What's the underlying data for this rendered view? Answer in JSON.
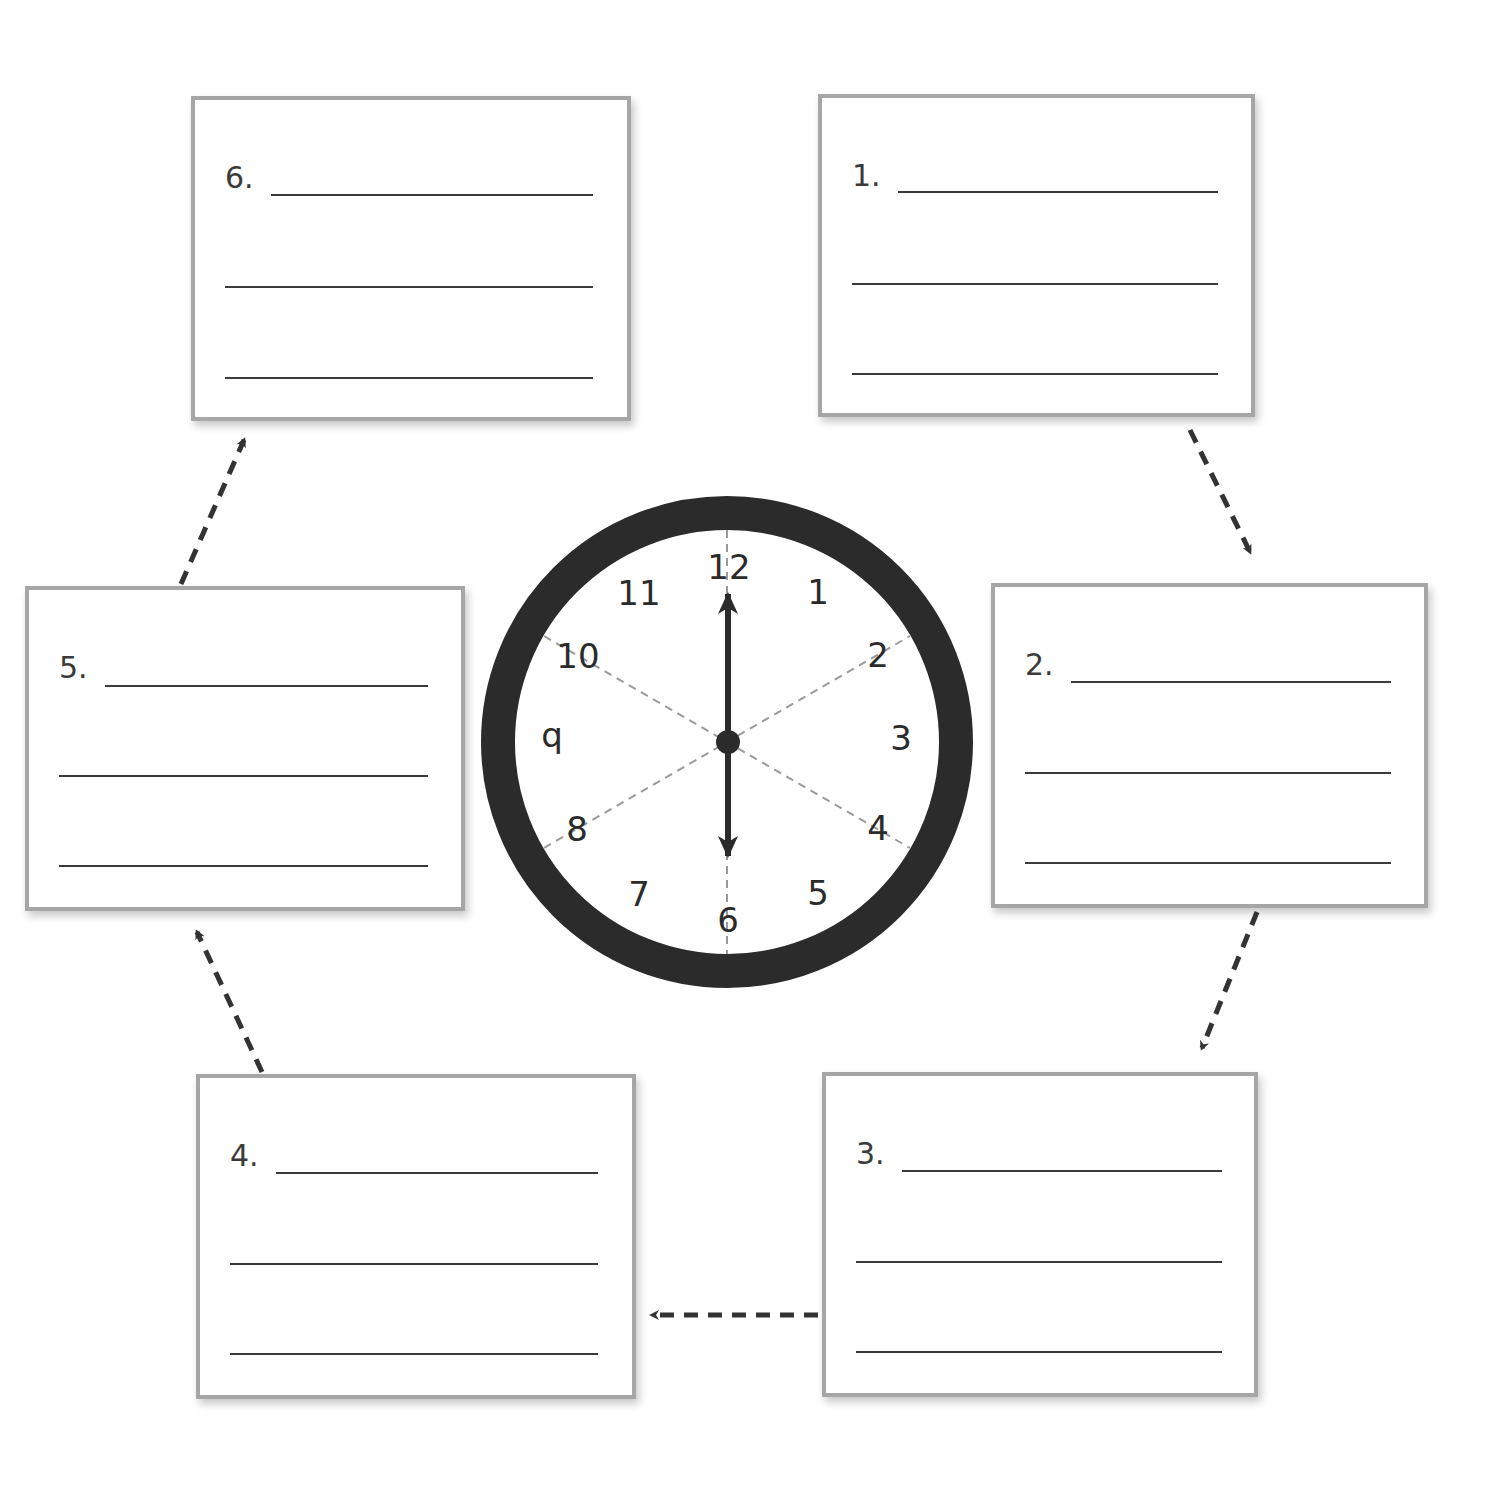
{
  "worksheet": {
    "type": "sequence cycle organizer",
    "boxes": [
      {
        "id": 1,
        "label": "1.",
        "lines": 3
      },
      {
        "id": 2,
        "label": "2.",
        "lines": 3
      },
      {
        "id": 3,
        "label": "3.",
        "lines": 3
      },
      {
        "id": 4,
        "label": "4.",
        "lines": 3
      },
      {
        "id": 5,
        "label": "5.",
        "lines": 3
      },
      {
        "id": 6,
        "label": "6.",
        "lines": 3
      }
    ],
    "arrows": [
      {
        "from": 1,
        "to": 2
      },
      {
        "from": 2,
        "to": 3
      },
      {
        "from": 3,
        "to": 4
      },
      {
        "from": 4,
        "to": 5
      },
      {
        "from": 5,
        "to": 6
      }
    ]
  },
  "clock": {
    "numbers": [
      "12",
      "1",
      "2",
      "3",
      "4",
      "5",
      "6",
      "7",
      "8",
      "q",
      "10",
      "11"
    ],
    "time_shown": "6:00",
    "hand_style": "double-headed arrow from 12 to 6",
    "divisions": 6,
    "colors": {
      "rim": "#2b2b2b",
      "hand": "#2b2b2b",
      "guide": "#9a9a9a"
    }
  }
}
